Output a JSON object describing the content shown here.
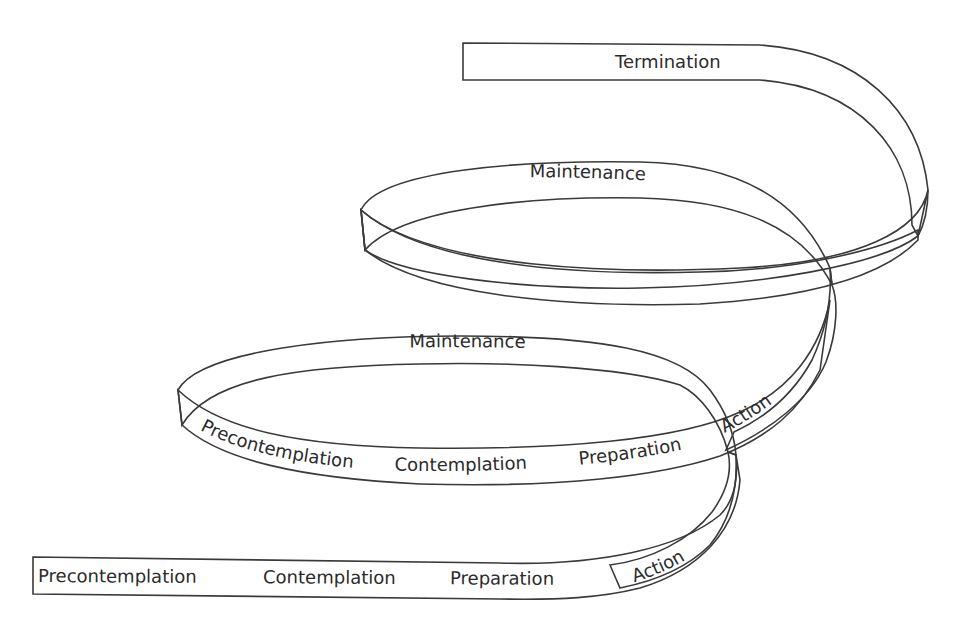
{
  "diagram": {
    "type": "spiral-ribbon",
    "colors": {
      "ribbon_light": "#ececec",
      "ribbon_dark": "#a9a9a9",
      "outline": "#3a3a3a",
      "text": "#2b2b2b",
      "background": "#ffffff"
    },
    "bottom_strip": {
      "labels": [
        "Precontemplation",
        "Contemplation",
        "Preparation",
        "Action"
      ]
    },
    "lower_loop": {
      "top_label": "Maintenance",
      "bottom_labels": [
        "Precontemplation",
        "Contemplation",
        "Preparation",
        "Action"
      ]
    },
    "upper_loop": {
      "top_label": "Maintenance"
    },
    "top_strip": {
      "label": "Termination"
    }
  }
}
